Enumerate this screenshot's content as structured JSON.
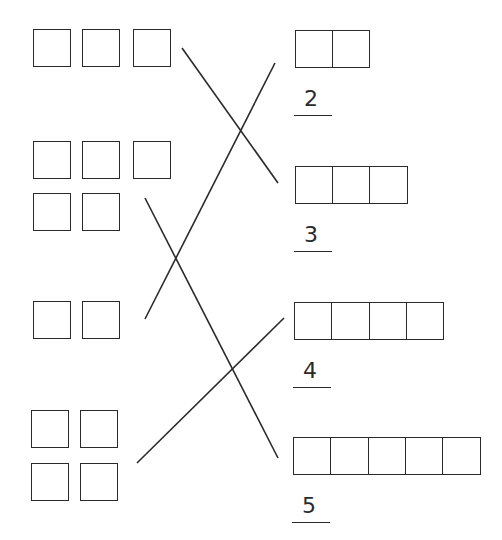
{
  "worksheet": {
    "left_groups": [
      {
        "count": 3,
        "squares": [
          [
            33,
            29
          ],
          [
            82,
            29
          ],
          [
            133,
            29
          ]
        ]
      },
      {
        "count": 5,
        "squares": [
          [
            33,
            141
          ],
          [
            82,
            141
          ],
          [
            133,
            141
          ],
          [
            33,
            193
          ],
          [
            82,
            193
          ]
        ]
      },
      {
        "count": 2,
        "squares": [
          [
            33,
            301
          ],
          [
            82,
            301
          ]
        ]
      },
      {
        "count": 4,
        "squares": [
          [
            31,
            410
          ],
          [
            80,
            410
          ],
          [
            31,
            463
          ],
          [
            80,
            463
          ]
        ]
      }
    ],
    "right_items": [
      {
        "cells": 2,
        "x": 295,
        "y": 30,
        "label": "2",
        "label_y": 88,
        "line_y": 115
      },
      {
        "cells": 3,
        "x": 295,
        "y": 166,
        "label": "3",
        "label_y": 224,
        "line_y": 251
      },
      {
        "cells": 4,
        "x": 294,
        "y": 302,
        "label": "4",
        "label_y": 360,
        "line_y": 387
      },
      {
        "cells": 5,
        "x": 293,
        "y": 437,
        "label": "5",
        "label_y": 495,
        "line_y": 522
      }
    ],
    "connections": [
      {
        "from": "left-group-1",
        "to": "right-item-3",
        "x1": 182,
        "y1": 48,
        "x2": 278,
        "y2": 183
      },
      {
        "from": "left-group-3",
        "to": "right-item-2",
        "x1": 145,
        "y1": 319,
        "x2": 275,
        "y2": 63
      },
      {
        "from": "left-group-2",
        "to": "right-item-5",
        "x1": 145,
        "y1": 198,
        "x2": 278,
        "y2": 458
      },
      {
        "from": "left-group-4",
        "to": "right-item-4",
        "x1": 137,
        "y1": 463,
        "x2": 284,
        "y2": 318
      }
    ],
    "square_size": 38,
    "stroke_color": "#2a2a2a"
  }
}
